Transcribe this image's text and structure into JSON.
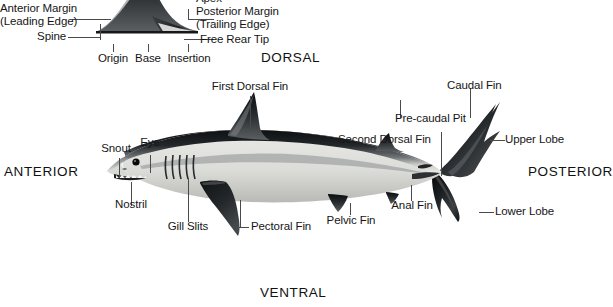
{
  "diagram": {
    "title_visible": false,
    "background_color": "#ffffff",
    "ink_color": "#161616",
    "leader_color": "#4a4a4a"
  },
  "fin_inset": {
    "name": "fin-terminology-inset",
    "labels": {
      "apex": "Apex",
      "anterior_margin": "Anterior Margin",
      "anterior_margin_alt": "(Leading Edge)",
      "posterior_margin": "Posterior Margin",
      "posterior_margin_alt": "(Trailing Edge)",
      "spine": "Spine",
      "free_rear_tip": "Free Rear Tip",
      "origin": "Origin",
      "base": "Base",
      "insertion": "Insertion"
    },
    "apex_clipped_top": true
  },
  "orientation": {
    "dorsal": "DORSAL",
    "ventral": "VENTRAL",
    "anterior": "ANTERIOR",
    "posterior": "POSTERIOR",
    "posterior_clipped_right": true
  },
  "shark": {
    "species_depicted": "shortfin mako shark",
    "body_dorsal_color": "#262a2d",
    "body_ventral_color": "#e8e8e6",
    "labels": [
      {
        "id": "first-dorsal-fin",
        "text": "First Dorsal Fin"
      },
      {
        "id": "second-dorsal-fin",
        "text": "Second Dorsal Fin"
      },
      {
        "id": "pre-caudal-pit",
        "text": "Pre-caudal Pit"
      },
      {
        "id": "caudal-fin",
        "text": "Caudal Fin"
      },
      {
        "id": "upper-lobe",
        "text": "Upper Lobe"
      },
      {
        "id": "lower-lobe",
        "text": "Lower Lobe"
      },
      {
        "id": "anal-fin",
        "text": "Anal Fin"
      },
      {
        "id": "pelvic-fin",
        "text": "Pelvic Fin"
      },
      {
        "id": "pectoral-fin",
        "text": "Pectoral Fin"
      },
      {
        "id": "gill-slits",
        "text": "Gill Slits"
      },
      {
        "id": "nostril",
        "text": "Nostril"
      },
      {
        "id": "snout",
        "text": "Snout"
      },
      {
        "id": "eye",
        "text": "Eye"
      }
    ]
  }
}
